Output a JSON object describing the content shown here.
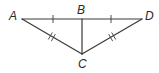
{
  "diagram": {
    "type": "geometry",
    "points": {
      "A": {
        "label": "A",
        "x": 22,
        "y": 19,
        "lx": 9,
        "ly": 20
      },
      "B": {
        "label": "B",
        "x": 82,
        "y": 19,
        "lx": 77,
        "ly": 14
      },
      "D": {
        "label": "D",
        "x": 142,
        "y": 19,
        "lx": 145,
        "ly": 20
      },
      "C": {
        "label": "C",
        "x": 82,
        "y": 54,
        "lx": 78,
        "ly": 68
      }
    },
    "segments": [
      {
        "from": "A",
        "to": "D",
        "name": "AD"
      },
      {
        "from": "B",
        "to": "C",
        "name": "BC"
      },
      {
        "from": "A",
        "to": "C",
        "name": "AC"
      },
      {
        "from": "D",
        "to": "C",
        "name": "DC"
      }
    ],
    "congruence_marks": [
      {
        "segment": "AB",
        "ticks": 1
      },
      {
        "segment": "BD",
        "ticks": 1
      },
      {
        "segment": "AC",
        "ticks": 2
      },
      {
        "segment": "DC",
        "ticks": 2
      }
    ],
    "colors": {
      "line": "#3a3a3a",
      "label": "#2a2a2a",
      "background": "#ffffff"
    }
  }
}
